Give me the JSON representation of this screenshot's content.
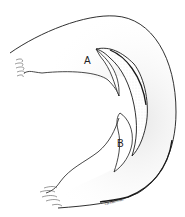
{
  "figure": {
    "type": "anatomical-line-drawing",
    "labels": {
      "a": "A",
      "b": "B"
    },
    "signature": "ca.haffman",
    "colors": {
      "outline": "#1a1a1a",
      "stipple_fill": "#d9d9d9",
      "background": "#ffffff"
    }
  }
}
